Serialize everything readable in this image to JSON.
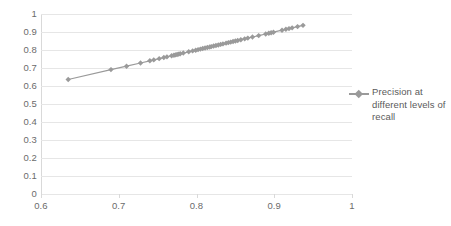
{
  "chart_data": {
    "type": "line",
    "title": "",
    "xlabel": "",
    "ylabel": "",
    "xlim": [
      0.6,
      1
    ],
    "ylim": [
      0,
      1
    ],
    "xticks": [
      "0.6",
      "0.7",
      "0.8",
      "0.9",
      "1"
    ],
    "xtick_values": [
      0.6,
      0.7,
      0.8,
      0.9,
      1.0
    ],
    "yticks": [
      "0",
      "0.1",
      "0.2",
      "0.3",
      "0.4",
      "0.5",
      "0.6",
      "0.7",
      "0.8",
      "0.9",
      "1"
    ],
    "ytick_values": [
      0,
      0.1,
      0.2,
      0.3,
      0.4,
      0.5,
      0.6,
      0.7,
      0.8,
      0.9,
      1.0
    ],
    "grid": "horizontal",
    "legend_position": "right",
    "series": [
      {
        "name": "Precision at different levels of recall",
        "color": "#9a9a9a",
        "marker": "diamond",
        "x": [
          0.635,
          0.69,
          0.71,
          0.728,
          0.74,
          0.745,
          0.752,
          0.758,
          0.762,
          0.768,
          0.771,
          0.773,
          0.775,
          0.777,
          0.779,
          0.783,
          0.79,
          0.795,
          0.799,
          0.802,
          0.805,
          0.808,
          0.811,
          0.814,
          0.817,
          0.819,
          0.822,
          0.825,
          0.828,
          0.831,
          0.834,
          0.838,
          0.841,
          0.844,
          0.847,
          0.85,
          0.853,
          0.857,
          0.862,
          0.866,
          0.872,
          0.88,
          0.889,
          0.893,
          0.896,
          0.899,
          0.91,
          0.915,
          0.919,
          0.923,
          0.93,
          0.937
        ],
        "y": [
          0.636,
          0.691,
          0.71,
          0.728,
          0.74,
          0.745,
          0.752,
          0.758,
          0.762,
          0.768,
          0.771,
          0.773,
          0.775,
          0.777,
          0.779,
          0.783,
          0.79,
          0.795,
          0.799,
          0.802,
          0.805,
          0.808,
          0.811,
          0.814,
          0.817,
          0.819,
          0.822,
          0.825,
          0.828,
          0.831,
          0.834,
          0.838,
          0.841,
          0.844,
          0.847,
          0.85,
          0.853,
          0.857,
          0.862,
          0.866,
          0.872,
          0.88,
          0.889,
          0.893,
          0.896,
          0.899,
          0.91,
          0.915,
          0.919,
          0.923,
          0.93,
          0.937
        ]
      }
    ]
  },
  "legend": {
    "entries": [
      {
        "label": "Precision at different levels of recall",
        "color": "#9a9a9a"
      }
    ]
  },
  "colors": {
    "series": "#9a9a9a",
    "gridline": "#e6e6e6",
    "axis": "#d9d9d9",
    "tick_text": "#6b6b6b",
    "legend_text": "#5a5a5a",
    "background": "#ffffff"
  }
}
